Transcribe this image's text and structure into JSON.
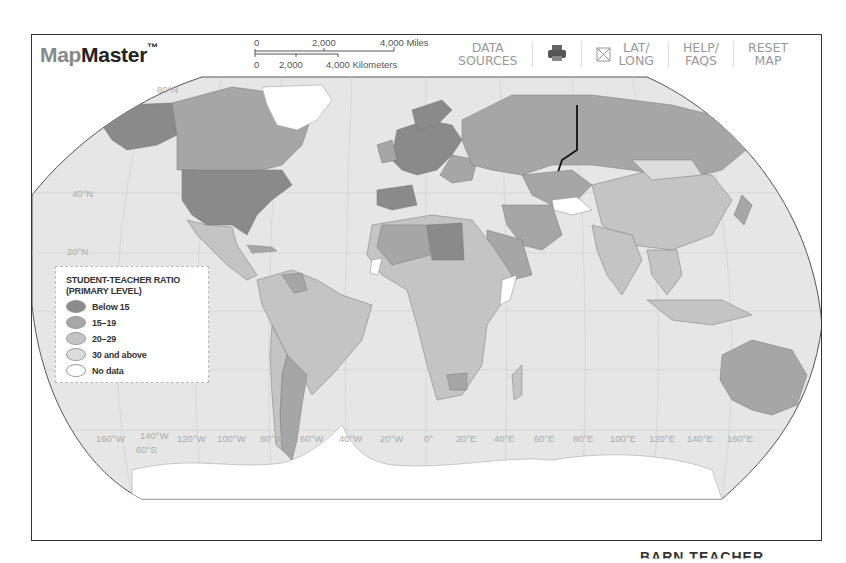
{
  "app": {
    "logo_prefix": "Map",
    "logo_main": "Master",
    "logo_tm": "™"
  },
  "scale_bar": {
    "miles": {
      "start": "0",
      "mid": "2,000",
      "end": "4,000 Miles"
    },
    "kilometers": {
      "start": "0",
      "mid": "2,000",
      "end": "4,000 Kilometers"
    }
  },
  "toolbar": {
    "data_sources_line1": "DATA",
    "data_sources_line2": "SOURCES",
    "print_icon": "printer-icon",
    "latlong_icon": "crossed-box-icon",
    "latlong_line1": "LAT/",
    "latlong_line2": "LONG",
    "help_line1": "HELP/",
    "help_line2": "FAQS",
    "reset_line1": "RESET",
    "reset_line2": "MAP"
  },
  "legend": {
    "title_line1": "STUDENT-TEACHER RATIO",
    "title_line2": "(PRIMARY LEVEL)",
    "items": [
      {
        "label": "Below 15",
        "color": "#8a8a8a"
      },
      {
        "label": "15–19",
        "color": "#a6a6a6"
      },
      {
        "label": "20–29",
        "color": "#c4c4c4"
      },
      {
        "label": "30 and above",
        "color": "#dcdcdc"
      },
      {
        "label": "No data",
        "color": "#ffffff"
      }
    ]
  },
  "graticule": {
    "latitudes": [
      "80°N",
      "40°N",
      "20°N",
      "60°S"
    ],
    "longitudes": [
      "160°W",
      "140°W",
      "120°W",
      "100°W",
      "80°W",
      "60°W",
      "40°W",
      "20°W",
      "0°",
      "20°E",
      "40°E",
      "60°E",
      "80°E",
      "100°E",
      "120°E",
      "140°E",
      "160°E"
    ]
  },
  "colors": {
    "ocean": "#e6e6e6",
    "below15": "#8a8a8a",
    "r15_19": "#a6a6a6",
    "r20_29": "#c4c4c4",
    "r30plus": "#dcdcdc",
    "nodata": "#ffffff",
    "border": "#777777"
  },
  "footer": {
    "cutoff_text": "BARN TEACHER"
  }
}
